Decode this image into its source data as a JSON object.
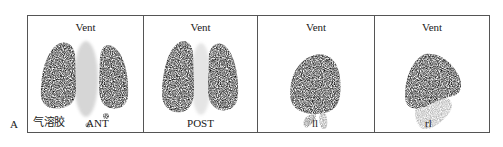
{
  "figure": {
    "label": "A",
    "panels": [
      {
        "title": "Vent",
        "view": "ANT",
        "tracer_label": "气溶胶"
      },
      {
        "title": "Vent",
        "view": "POST"
      },
      {
        "title": "Vent",
        "view": "ll"
      },
      {
        "title": "Vent",
        "view": "rl"
      }
    ]
  },
  "colors": {
    "background": "#ffffff",
    "border": "#555555",
    "uptake": "#0a0a0a"
  }
}
